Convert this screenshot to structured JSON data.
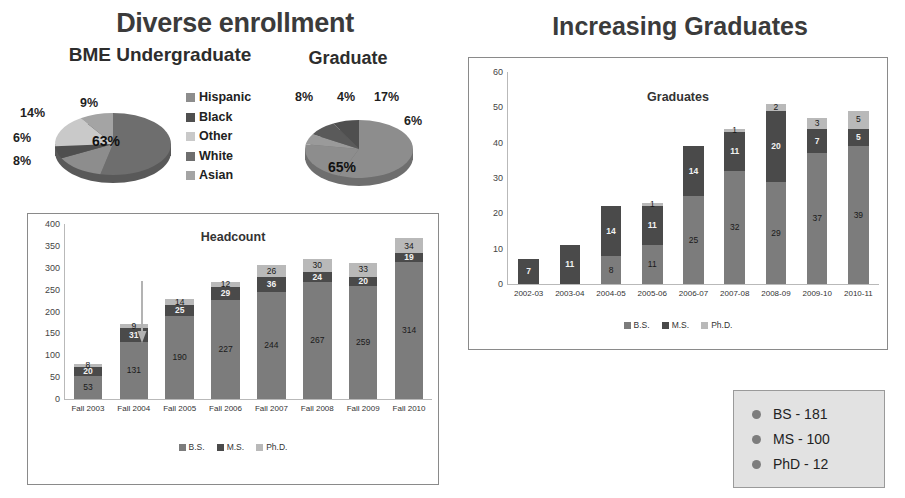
{
  "slide": {
    "title_left": "Diverse enrollment",
    "title_right": "Increasing Graduates",
    "subtitle_undergrad": "BME Undergraduate",
    "subtitle_graduate": "Graduate"
  },
  "colors": {
    "bs": "#7c7c7c",
    "ms": "#4a4a4a",
    "phd": "#b9b9b9",
    "pie_hispanic": "#8d8d8d",
    "pie_black": "#4f4f4f",
    "pie_other": "#c9c9c9",
    "pie_white": "#6e6e6e",
    "pie_asian": "#a4a4a4",
    "panel_border": "#8a8a8a",
    "summary_bg": "#e2e2e2",
    "bullet": "#7d7d7d"
  },
  "pie_legend": [
    {
      "label": "Hispanic",
      "color": "#8d8d8d"
    },
    {
      "label": "Black",
      "color": "#4f4f4f"
    },
    {
      "label": "Other",
      "color": "#c9c9c9"
    },
    {
      "label": "White",
      "color": "#6e6e6e"
    },
    {
      "label": "Asian",
      "color": "#a4a4a4"
    }
  ],
  "chart_data": [
    {
      "type": "pie",
      "title": "BME Undergraduate",
      "labels": [
        "White",
        "Asian",
        "Other",
        "Black",
        "Hispanic"
      ],
      "values": [
        63,
        9,
        14,
        6,
        8
      ],
      "value_labels": [
        "63%",
        "9%",
        "14%",
        "6%",
        "8%"
      ],
      "legend": [
        "Hispanic",
        "Black",
        "Other",
        "White",
        "Asian"
      ],
      "legend_position": "right"
    },
    {
      "type": "pie",
      "title": "Graduate",
      "labels": [
        "White",
        "Asian",
        "Other",
        "Black",
        "Hispanic"
      ],
      "values": [
        65,
        4,
        8,
        6,
        17
      ],
      "value_labels": [
        "65%",
        "4%",
        "8%",
        "6%",
        "17%"
      ],
      "legend": [
        "Hispanic",
        "Black",
        "Other",
        "White",
        "Asian"
      ],
      "legend_position": "shared-left"
    },
    {
      "type": "bar",
      "stacked": true,
      "title": "Headcount",
      "xlabel": "",
      "ylabel": "",
      "ylim": [
        0,
        400
      ],
      "ytick_step": 50,
      "yticks": [
        "0",
        "50",
        "100",
        "150",
        "200",
        "250",
        "300",
        "350",
        "400"
      ],
      "grid": false,
      "categories": [
        "Fall 2003",
        "Fall 2004",
        "Fall 2005",
        "Fall 2006",
        "Fall 2007",
        "Fall 2008",
        "Fall 2009",
        "Fall 2010"
      ],
      "series": [
        {
          "name": "B.S.",
          "color": "#7c7c7c",
          "values": [
            53,
            131,
            190,
            227,
            244,
            267,
            259,
            314
          ]
        },
        {
          "name": "M.S.",
          "color": "#4a4a4a",
          "values": [
            20,
            31,
            25,
            29,
            36,
            24,
            20,
            19
          ]
        },
        {
          "name": "Ph.D.",
          "color": "#b9b9b9",
          "values": [
            8,
            9,
            14,
            12,
            26,
            30,
            33,
            34
          ]
        }
      ],
      "legend": [
        "B.S.",
        "M.S.",
        "Ph.D."
      ],
      "legend_position": "bottom",
      "annotation": {
        "type": "arrow",
        "points_to": "Fall 2004"
      }
    },
    {
      "type": "bar",
      "stacked": true,
      "title": "Graduates",
      "xlabel": "",
      "ylabel": "",
      "ylim": [
        0,
        60
      ],
      "ytick_step": 10,
      "yticks": [
        "0",
        "10",
        "20",
        "30",
        "40",
        "50",
        "60"
      ],
      "grid": false,
      "categories": [
        "2002-03",
        "2003-04",
        "2004-05",
        "2005-06",
        "2006-07",
        "2007-08",
        "2008-09",
        "2009-10",
        "2010-11"
      ],
      "series": [
        {
          "name": "B.S.",
          "color": "#7c7c7c",
          "values": [
            0,
            0,
            8,
            11,
            25,
            32,
            29,
            37,
            39
          ]
        },
        {
          "name": "M.S.",
          "color": "#4a4a4a",
          "values": [
            7,
            11,
            14,
            11,
            14,
            11,
            20,
            7,
            5
          ]
        },
        {
          "name": "Ph.D.",
          "color": "#b9b9b9",
          "values": [
            0,
            0,
            0,
            1,
            0,
            1,
            2,
            3,
            5
          ]
        }
      ],
      "legend": [
        "B.S.",
        "M.S.",
        "Ph.D."
      ],
      "legend_position": "bottom"
    }
  ],
  "summary": {
    "items": [
      {
        "label": "BS - 181"
      },
      {
        "label": "MS - 100"
      },
      {
        "label": "PhD - 12"
      }
    ]
  }
}
